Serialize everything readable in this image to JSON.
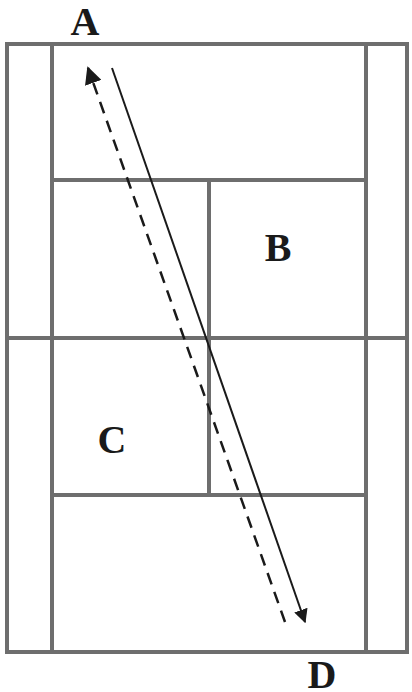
{
  "diagram": {
    "type": "badminton-court-top-view",
    "labels": {
      "a": "A",
      "b": "B",
      "c": "C",
      "d": "D"
    },
    "colors": {
      "court_line": "#6e6e6e",
      "arrow": "#1a1a1a",
      "background": "#ffffff"
    },
    "court": {
      "outer": {
        "x1": 7,
        "y1": 44,
        "x2": 407,
        "y2": 652
      },
      "singles_sidelines_x": [
        52,
        366
      ],
      "short_service_lines_y": [
        180,
        495
      ],
      "net_y": 338,
      "center_line_x": 209
    },
    "arrows": [
      {
        "name": "solid-shot",
        "style": "solid",
        "from": [
          112,
          68
        ],
        "to": [
          305,
          622
        ]
      },
      {
        "name": "dashed-shot",
        "style": "dashed",
        "from": [
          285,
          622
        ],
        "to": [
          88,
          68
        ]
      }
    ]
  }
}
